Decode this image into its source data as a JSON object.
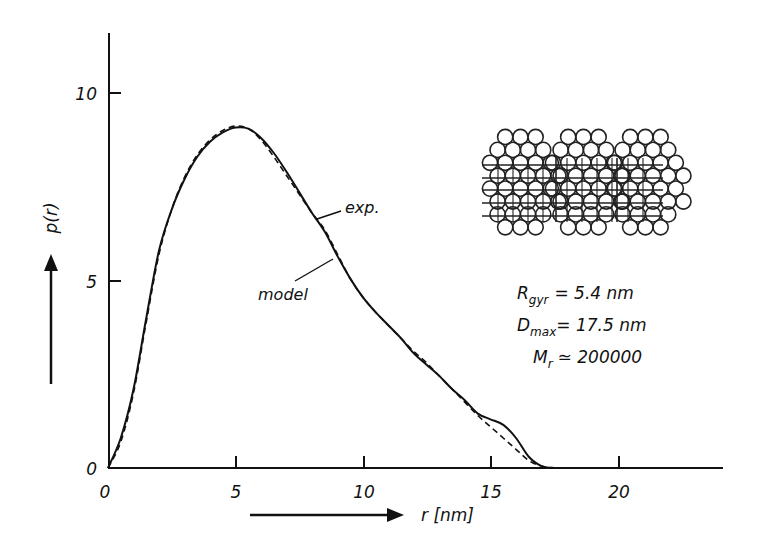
{
  "chart_data": {
    "type": "line",
    "title": "",
    "xlabel": "r [nm]",
    "ylabel": "p(r)",
    "xlim": [
      0,
      24
    ],
    "ylim": [
      0,
      11.7
    ],
    "x_ticks": [
      0,
      5,
      10,
      15,
      20
    ],
    "x_tick_labels": [
      "0",
      "5",
      "10",
      "15",
      "20"
    ],
    "y_ticks": [
      0,
      5,
      10
    ],
    "y_tick_labels": [
      "0",
      "5",
      "10"
    ],
    "grid": false,
    "series": [
      {
        "name": "exp.",
        "style": "solid",
        "x": [
          0,
          0.5,
          1,
          1.5,
          2,
          2.5,
          3,
          3.5,
          4,
          4.5,
          5,
          5.5,
          6,
          6.5,
          7,
          7.5,
          8,
          8.5,
          9,
          9.5,
          10,
          10.5,
          11,
          11.5,
          12,
          12.5,
          13,
          13.5,
          14,
          14.5,
          15,
          15.5,
          16,
          16.5,
          17,
          17.5
        ],
        "y": [
          0,
          0.8,
          2.1,
          4.0,
          5.8,
          6.9,
          7.7,
          8.3,
          8.7,
          8.95,
          9.08,
          9.05,
          8.8,
          8.4,
          7.9,
          7.35,
          6.8,
          6.3,
          5.65,
          5.05,
          4.55,
          4.15,
          3.8,
          3.45,
          3.05,
          2.75,
          2.45,
          2.1,
          1.8,
          1.45,
          1.3,
          1.15,
          0.8,
          0.3,
          0.05,
          0
        ]
      },
      {
        "name": "model",
        "style": "dashed",
        "x": [
          0,
          0.5,
          1,
          1.5,
          2,
          2.5,
          3,
          3.5,
          4,
          4.5,
          5,
          5.5,
          6,
          6.5,
          7,
          7.5,
          8,
          8.5,
          9,
          9.5,
          10,
          10.5,
          11,
          11.5,
          12,
          12.5,
          13,
          13.5,
          14,
          14.5,
          15,
          15.5,
          16,
          16.5,
          17,
          17.5
        ],
        "y": [
          0,
          0.7,
          2.0,
          3.9,
          5.7,
          6.9,
          7.75,
          8.35,
          8.75,
          9.0,
          9.12,
          9.05,
          8.75,
          8.3,
          7.8,
          7.3,
          6.8,
          6.35,
          5.7,
          5.05,
          4.55,
          4.15,
          3.8,
          3.45,
          3.1,
          2.8,
          2.45,
          2.1,
          1.75,
          1.4,
          1.1,
          0.8,
          0.5,
          0.2,
          0.05,
          0
        ]
      }
    ],
    "annotations": [
      {
        "text": "exp.",
        "points_to": "solid curve near r≈8.3"
      },
      {
        "text": "model",
        "points_to": "dashed curve near r≈8.9"
      },
      {
        "text": "R_gyr = 5.4 nm"
      },
      {
        "text": "D_max = 17.5 nm"
      },
      {
        "text": "M_r ≃ 200000"
      }
    ],
    "inset": "sphere-packing model of three subunits (hexagonally packed circles)"
  },
  "labels": {
    "y_axis": "p(r)",
    "x_axis": "r [nm]",
    "exp": "exp.",
    "model": "model",
    "rgyr_sym": "R",
    "rgyr_sub": "gyr",
    "rgyr_val": "= 5.4 nm",
    "dmax_sym": "D",
    "dmax_sub": "max",
    "dmax_val": "= 17.5 nm",
    "mr_sym": "M",
    "mr_sub": "r",
    "mr_val": "≃ 200000",
    "xt0": "0",
    "xt5": "5",
    "xt10": "10",
    "xt15": "15",
    "xt20": "20",
    "yt0": "0",
    "yt5": "5",
    "yt10": "10"
  },
  "colors": {
    "ink": "#111111",
    "background": "#ffffff"
  }
}
